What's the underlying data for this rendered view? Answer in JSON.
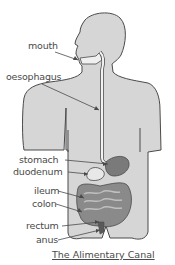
{
  "diagram": {
    "title": "The Alimentary Canal",
    "labels": [
      {
        "id": "mouth",
        "text": "mouth"
      },
      {
        "id": "oesophagus",
        "text": "oesophagus"
      },
      {
        "id": "stomach",
        "text": "stomach"
      },
      {
        "id": "duodenum",
        "text": "duodenum"
      },
      {
        "id": "ileum",
        "text": "ileum"
      },
      {
        "id": "colon",
        "text": "colon"
      },
      {
        "id": "rectum",
        "text": "rectum"
      },
      {
        "id": "anus",
        "text": "anus"
      }
    ],
    "colors": {
      "body_fill": "#d6d6d6",
      "outline": "#4a4a4a",
      "organ_dark": "#7a7a7a",
      "organ_mid": "#a8a8a8",
      "text": "#4a4a4a"
    }
  }
}
